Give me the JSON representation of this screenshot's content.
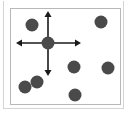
{
  "diagram": {
    "colors": {
      "dot": "#4a4a4a",
      "arrow": "#1a1a1a",
      "inner_border": "#b8b8b8",
      "outer_border": "#d4d4d4"
    },
    "dot_radius": 6.5,
    "dots": [
      {
        "x": 32,
        "y": 25
      },
      {
        "x": 101,
        "y": 22
      },
      {
        "x": 48,
        "y": 43,
        "selected": true
      },
      {
        "x": 74,
        "y": 67
      },
      {
        "x": 108,
        "y": 68
      },
      {
        "x": 37,
        "y": 82
      },
      {
        "x": 25,
        "y": 87
      },
      {
        "x": 75,
        "y": 95
      }
    ],
    "move_cursor": {
      "center": {
        "x": 48,
        "y": 43
      },
      "up": {
        "x": 48,
        "y": 11
      },
      "down": {
        "x": 48,
        "y": 76
      },
      "left": {
        "x": 16,
        "y": 43
      },
      "right": {
        "x": 81,
        "y": 43
      }
    }
  }
}
